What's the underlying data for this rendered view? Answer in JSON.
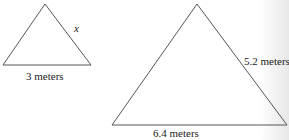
{
  "small_triangle": {
    "side_label": "x",
    "base_label": "3 meters"
  },
  "large_triangle": {
    "side_label": "5.2 meters",
    "base_label": "6.4 meters"
  },
  "colors": {
    "stroke": "#555555",
    "text": "#222222"
  }
}
